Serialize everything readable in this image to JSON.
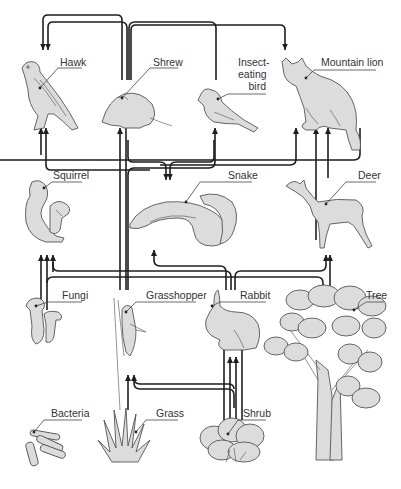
{
  "diagram": {
    "organisms": [
      {
        "id": "hawk",
        "label": "Hawk",
        "level": "top consumer"
      },
      {
        "id": "shrew",
        "label": "Shrew",
        "level": "consumer"
      },
      {
        "id": "insect_bird",
        "label": "Insect-\neating\nbird",
        "label_lines": [
          "Insect-",
          "eating",
          "bird"
        ],
        "level": "consumer"
      },
      {
        "id": "mountain_lion",
        "label": "Mountain lion",
        "level": "top consumer"
      },
      {
        "id": "squirrel",
        "label": "Squirrel",
        "level": "primary consumer"
      },
      {
        "id": "snake",
        "label": "Snake",
        "level": "consumer"
      },
      {
        "id": "deer",
        "label": "Deer",
        "level": "primary consumer"
      },
      {
        "id": "fungi",
        "label": "Fungi",
        "level": "decomposer"
      },
      {
        "id": "grasshopper",
        "label": "Grasshopper",
        "level": "primary consumer"
      },
      {
        "id": "rabbit",
        "label": "Rabbit",
        "level": "primary consumer"
      },
      {
        "id": "tree",
        "label": "Tree",
        "level": "producer"
      },
      {
        "id": "bacteria",
        "label": "Bacteria",
        "level": "decomposer"
      },
      {
        "id": "grass",
        "label": "Grass",
        "level": "producer"
      },
      {
        "id": "shrub",
        "label": "Shrub",
        "level": "producer"
      }
    ],
    "energy_flows": [
      {
        "from": "Shrew",
        "to": "Hawk"
      },
      {
        "from": "Insect-eating bird",
        "to": "Hawk"
      },
      {
        "from": "Shrew",
        "to": "Mountain lion"
      },
      {
        "from": "Squirrel",
        "to": "Hawk"
      },
      {
        "from": "Snake",
        "to": "Hawk"
      },
      {
        "from": "Grasshopper",
        "to": "Shrew"
      },
      {
        "from": "Grasshopper",
        "to": "Insect-eating bird"
      },
      {
        "from": "Shrew",
        "to": "Snake"
      },
      {
        "from": "Snake",
        "to": "Mountain lion"
      },
      {
        "from": "Deer",
        "to": "Mountain lion"
      },
      {
        "from": "Rabbit",
        "to": "Mountain lion"
      },
      {
        "from": "Rabbit",
        "to": "Snake"
      },
      {
        "from": "Fungi",
        "to": "Squirrel"
      },
      {
        "from": "Tree",
        "to": "Squirrel"
      },
      {
        "from": "Rabbit",
        "to": "Squirrel"
      },
      {
        "from": "Tree",
        "to": "Deer"
      },
      {
        "from": "Rabbit",
        "to": "Deer"
      },
      {
        "from": "Grass",
        "to": "Grasshopper"
      },
      {
        "from": "Shrub",
        "to": "Grasshopper"
      },
      {
        "from": "Shrub",
        "to": "Rabbit"
      },
      {
        "from": "Grass",
        "to": "Rabbit"
      }
    ]
  },
  "colors": {
    "organism_fill": "#dcdcdc",
    "organism_stroke": "#555555",
    "arrow": "#1e1e1e",
    "label_text": "#333333"
  }
}
